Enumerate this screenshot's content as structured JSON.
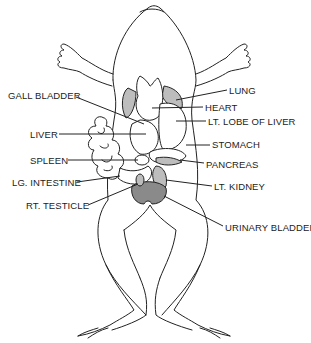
{
  "diagram": {
    "labels": [
      {
        "id": "lung",
        "text": "LUNG",
        "x": 229,
        "y": 86
      },
      {
        "id": "gall-bladder",
        "text": "GALL BLADDER",
        "x": 8,
        "y": 91
      },
      {
        "id": "heart",
        "text": "HEART",
        "x": 205,
        "y": 103
      },
      {
        "id": "lt-lobe-of-liver",
        "text": "LT. LOBE OF LIVER",
        "x": 208,
        "y": 117
      },
      {
        "id": "liver",
        "text": "LIVER",
        "x": 30,
        "y": 130
      },
      {
        "id": "stomach",
        "text": "STOMACH",
        "x": 212,
        "y": 140
      },
      {
        "id": "spleen",
        "text": "SPLEEN",
        "x": 30,
        "y": 156
      },
      {
        "id": "pancreas",
        "text": "PANCREAS",
        "x": 206,
        "y": 160
      },
      {
        "id": "lg-intestine",
        "text": "LG. INTESTINE",
        "x": 12,
        "y": 178
      },
      {
        "id": "lt-kidney",
        "text": "LT. KIDNEY",
        "x": 214,
        "y": 182
      },
      {
        "id": "rt-testicle",
        "text": "RT. TESTICLE",
        "x": 26,
        "y": 201
      },
      {
        "id": "urinary-bladder",
        "text": "URINARY BLADDER",
        "x": 225,
        "y": 223
      }
    ],
    "colors": {
      "line": "#222222",
      "background": "#ffffff",
      "shading": "#bdbdbd"
    }
  }
}
